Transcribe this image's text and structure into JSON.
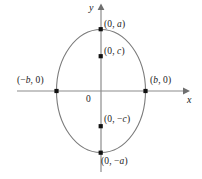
{
  "figure": {
    "background_color": "#ffffff",
    "axis_color": "#8c8c8c",
    "curve_color": "#7a7a7a",
    "point_color": "#111111",
    "text_color": "#1a1a1a",
    "width": 202,
    "height": 179
  },
  "axes": {
    "x_label": "x",
    "y_label": "y",
    "origin_label": "0"
  },
  "labels": {
    "top_vertex": "(0, a)",
    "upper_focus": "(0, c)",
    "lower_focus": "(0, −c)",
    "bottom_vertex": "(0, −a)",
    "left_vertex": "(−b, 0)",
    "right_vertex": "(b, 0)"
  },
  "chart_data": {
    "type": "scatter",
    "xlabel": "x",
    "ylabel": "y",
    "grid": false,
    "legend": null,
    "xlim": [
      -1.6,
      1.6
    ],
    "ylim": [
      -1.35,
      1.35
    ],
    "curves": [
      {
        "name": "ellipse",
        "equation": "x^2/b^2 + y^2/a^2 = 1",
        "center": [
          0,
          0
        ],
        "semi_major_axis_a": 1.0,
        "semi_minor_axis_b": 0.72,
        "major_axis_orientation": "vertical"
      }
    ],
    "points": [
      {
        "name": "top-vertex",
        "label": "(0, a)",
        "x": 0,
        "y": 1.0
      },
      {
        "name": "upper-focus",
        "label": "(0, c)",
        "x": 0,
        "y": 0.56
      },
      {
        "name": "lower-focus",
        "label": "(0, −c)",
        "x": 0,
        "y": -0.56
      },
      {
        "name": "bottom-vertex",
        "label": "(0, −a)",
        "x": 0,
        "y": -1.0
      },
      {
        "name": "left-vertex",
        "label": "(−b, 0)",
        "x": -0.72,
        "y": 0
      },
      {
        "name": "right-vertex",
        "label": "(b, 0)",
        "x": 0.72,
        "y": 0
      }
    ]
  }
}
